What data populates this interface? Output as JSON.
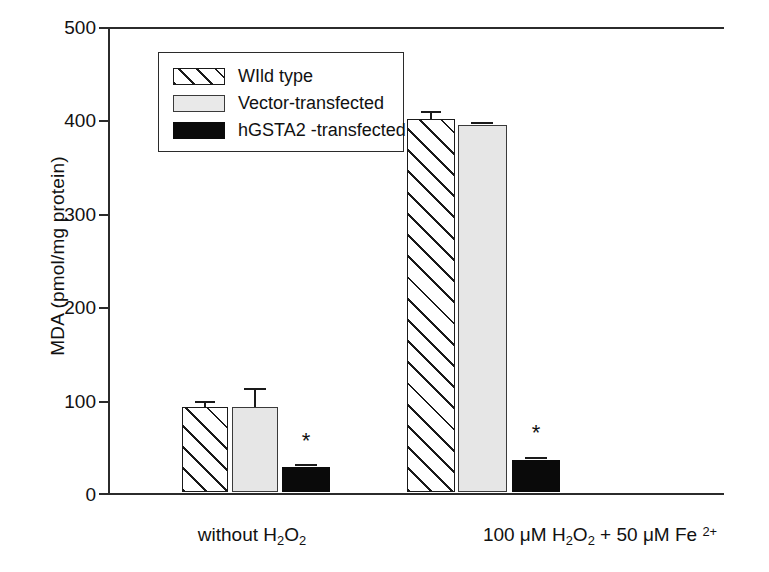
{
  "chart_data": {
    "type": "bar",
    "title": "",
    "subtitle": "",
    "xlabel": "",
    "ylabel": "MDA (pmol/mg protein)",
    "ylim": [
      0,
      500
    ],
    "yticks": [
      0,
      100,
      200,
      300,
      400,
      500
    ],
    "ytick_labels": [
      "0",
      "100",
      "200",
      "300",
      "400",
      "500"
    ],
    "grid": false,
    "legend_position": "upper-left-inside",
    "categories": [
      "without H2O2",
      "100 uM H2O2 + 50 uM Fe2+"
    ],
    "category_labels_html": [
      "without H<sub>2</sub>O<sub>2</sub>",
      "100 μM H<sub>2</sub>O<sub>2</sub> + 50 μM Fe <sup>2+</sup>"
    ],
    "series": [
      {
        "name": "WIld type",
        "fill": "hatched",
        "values": [
          91,
          399
        ],
        "errors": [
          3,
          7
        ]
      },
      {
        "name": "Vector-transfected",
        "fill": "light-grey",
        "values": [
          91,
          393
        ],
        "errors": [
          14,
          3
        ]
      },
      {
        "name": "hGSTA2 -transfected",
        "fill": "black",
        "values": [
          26,
          34
        ],
        "errors": [
          3,
          3
        ]
      }
    ],
    "annotations": [
      {
        "text": "*",
        "series": "hGSTA2 -transfected",
        "category": "without H2O2"
      },
      {
        "text": "*",
        "series": "hGSTA2 -transfected",
        "category": "100 uM H2O2 + 50 uM Fe2+"
      }
    ],
    "colors": {
      "axis": "#2b2b2b",
      "hatched_fill": "#ffffff",
      "hatched_line": "#1a1a1a",
      "grey_fill": "#e6e6e6",
      "black_fill": "#0a0a0a",
      "text": "#111111",
      "background": "#ffffff"
    }
  },
  "axis": {
    "y_title": "MDA (pmol/mg protein)",
    "ticks": {
      "t500": "500",
      "t400": "400",
      "t300": "300",
      "t200": "200",
      "t100": "100",
      "t0": "0"
    }
  },
  "legend": {
    "items": [
      {
        "label": "WIld type",
        "swatch": "hatched-swatch"
      },
      {
        "label": "Vector-transfected",
        "swatch": "grey-swatch"
      },
      {
        "label": "hGSTA2  -transfected",
        "swatch": "black-swatch"
      }
    ]
  },
  "significance": {
    "star": "*"
  }
}
